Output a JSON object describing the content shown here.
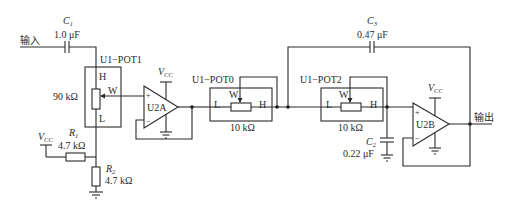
{
  "diagram": {
    "type": "circuit-schematic",
    "input_label": "输入",
    "output_label": "输出",
    "components": {
      "c1": {
        "name": "C",
        "sub": "1",
        "value": "1.0 μF"
      },
      "c2": {
        "name": "C",
        "sub": "2",
        "value": "0.22 μF"
      },
      "c3": {
        "name": "C",
        "sub": "3",
        "value": "0.47 μF"
      },
      "r1": {
        "name": "R",
        "sub": "1",
        "value": "4.7 kΩ"
      },
      "r2": {
        "name": "R",
        "sub": "2",
        "value": "4.7 kΩ"
      },
      "pot1": {
        "name": "U1−POT1",
        "value": "90 kΩ",
        "pin_h": "H",
        "pin_w": "W",
        "pin_l": "L"
      },
      "pot0": {
        "name": "U1−POT0",
        "value": "10 kΩ",
        "pin_h": "H",
        "pin_w": "W",
        "pin_l": "L"
      },
      "pot2": {
        "name": "U1−POT2",
        "value": "10 kΩ",
        "pin_h": "H",
        "pin_w": "W",
        "pin_l": "L"
      },
      "u2a": {
        "name": "U2A",
        "plus": "+",
        "minus": "−"
      },
      "u2b": {
        "name": "U2B",
        "plus": "+",
        "minus": "−"
      }
    },
    "supply": {
      "v": "V",
      "sub": "CC"
    }
  }
}
